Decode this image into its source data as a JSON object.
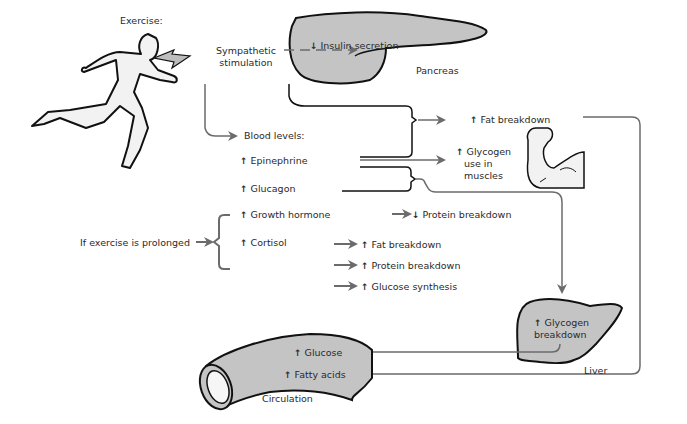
{
  "title": "Exercise:",
  "trigger": {
    "sympathetic": [
      "Sympathetic",
      "stimulation"
    ],
    "blood_levels": "Blood levels:",
    "prolonged": "If exercise is prolonged"
  },
  "hormones": [
    {
      "name": "Epinephrine",
      "direction": "up"
    },
    {
      "name": "Glucagon",
      "direction": "up"
    },
    {
      "name": "Growth hormone",
      "direction": "up"
    },
    {
      "name": "Cortisol",
      "direction": "up"
    }
  ],
  "pancreas": {
    "label": "Pancreas",
    "effect": "Insulin secretion",
    "direction": "down"
  },
  "muscle": {
    "fat_breakdown": "Fat breakdown",
    "glycogen_use": [
      "Glycogen",
      "use in",
      "muscles"
    ]
  },
  "growth_hormone_effect": {
    "label": "Protein breakdown",
    "direction": "down"
  },
  "cortisol_effects": [
    {
      "label": "Fat breakdown",
      "direction": "up"
    },
    {
      "label": "Protein breakdown",
      "direction": "up"
    },
    {
      "label": "Glucose synthesis",
      "direction": "up"
    }
  ],
  "liver": {
    "label": "Liver",
    "effect": [
      "Glycogen",
      "breakdown"
    ],
    "direction": "up"
  },
  "circulation": {
    "label": "Circulation",
    "items": [
      {
        "label": "Glucose",
        "direction": "up"
      },
      {
        "label": "Fatty acids",
        "direction": "up"
      }
    ]
  },
  "colors": {
    "arrow": "#6b6b6b",
    "organ_fill": "#c4c4c4",
    "outline": "#111111",
    "figure_fill": "#f2f2f2"
  }
}
